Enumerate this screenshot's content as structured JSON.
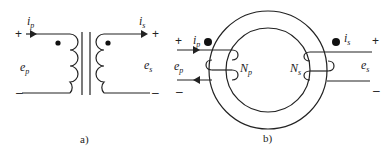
{
  "figure_a": {
    "caption": "a)",
    "primary_current": {
      "symbol": "i",
      "sub": "p"
    },
    "secondary_current": {
      "symbol": "i",
      "sub": "s"
    },
    "primary_voltage": {
      "symbol": "e",
      "sub": "p"
    },
    "secondary_voltage": {
      "symbol": "e",
      "sub": "s"
    },
    "plus": "+",
    "minus": "–"
  },
  "figure_b": {
    "caption": "b)",
    "primary_current": {
      "symbol": "i",
      "sub": "p"
    },
    "secondary_current": {
      "symbol": "i",
      "sub": "s"
    },
    "primary_voltage": {
      "symbol": "e",
      "sub": "p"
    },
    "secondary_voltage": {
      "symbol": "e",
      "sub": "s"
    },
    "primary_turns": {
      "symbol": "N",
      "sub": "p"
    },
    "secondary_turns": {
      "symbol": "N",
      "sub": "s"
    },
    "plus": "+",
    "minus": "–"
  },
  "colors": {
    "ink": "#222222",
    "background": "#ffffff"
  }
}
